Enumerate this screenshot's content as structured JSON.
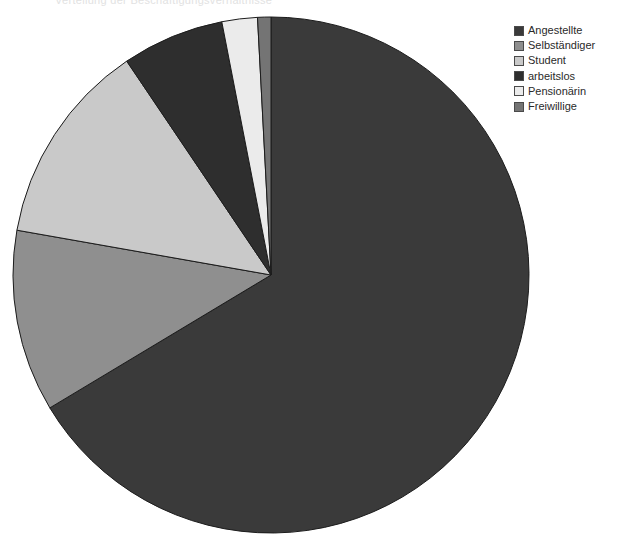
{
  "header": {
    "clipped_text": "Verteilung der Beschäftigungsverhältnisse"
  },
  "legend": {
    "position": "top-right",
    "items": [
      {
        "label": "Angestellte",
        "color": "#3a3a3a"
      },
      {
        "label": "Selbständiger",
        "color": "#8f8f8f"
      },
      {
        "label": "Student",
        "color": "#c9c9c9"
      },
      {
        "label": "arbeitslos",
        "color": "#2e2e2e"
      },
      {
        "label": "Pensionärin",
        "color": "#ebebeb"
      },
      {
        "label": "Freiwillige",
        "color": "#747474"
      }
    ]
  },
  "pie": {
    "center_x": 271,
    "center_y": 275,
    "radius": 258,
    "stroke": "#1c1c1c",
    "stroke_width": 1
  },
  "chart_data": {
    "type": "pie",
    "title": "",
    "labels": [
      "Angestellte",
      "Selbständiger",
      "Student",
      "arbeitslos",
      "Pensionärin",
      "Freiwillige"
    ],
    "values": [
      66.4,
      11.4,
      12.8,
      6.4,
      2.2,
      0.8
    ],
    "units": "percent",
    "angles_deg": [
      239,
      41,
      46,
      23,
      8,
      3
    ],
    "colors": [
      "#3a3a3a",
      "#8f8f8f",
      "#c9c9c9",
      "#2e2e2e",
      "#ebebeb",
      "#747474"
    ],
    "start_angle_deg": 0,
    "direction": "clockwise",
    "legend_position": "top-right",
    "grid": false,
    "annotations": []
  }
}
